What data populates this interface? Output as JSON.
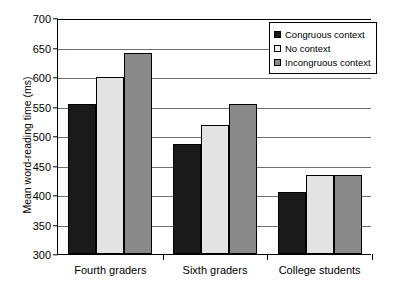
{
  "chart_data": {
    "type": "bar",
    "title": "",
    "xlabel": "",
    "ylabel": "Mean word-reading time (ms)",
    "categories": [
      "Fourth graders",
      "Sixth graders",
      "College students"
    ],
    "series": [
      {
        "name": "Congruous context",
        "color": "#1a1a1a",
        "values": [
          554,
          487,
          405
        ]
      },
      {
        "name": "No context",
        "color": "#e3e3e3",
        "values": [
          600,
          519,
          434
        ]
      },
      {
        "name": "Incongruous context",
        "color": "#8a8a8a",
        "values": [
          640,
          554,
          434
        ]
      }
    ],
    "ylim": [
      300,
      700
    ],
    "yticks": [
      300,
      350,
      400,
      450,
      500,
      550,
      600,
      650,
      700
    ],
    "ytick_labels": [
      "300",
      "350",
      "400",
      "450",
      "500",
      "550",
      "600",
      "650",
      "700"
    ],
    "grid": true,
    "legend_position": "upper-right"
  }
}
